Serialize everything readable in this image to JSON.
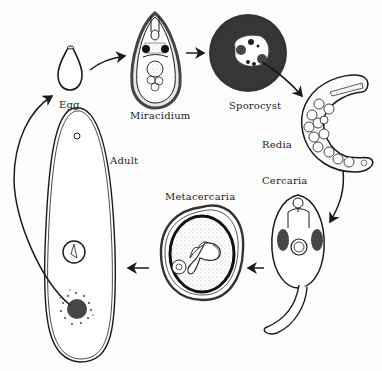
{
  "diagram": {
    "type": "life-cycle",
    "stages": [
      {
        "id": "egg",
        "label": "Egg"
      },
      {
        "id": "miracidium",
        "label": "Miracidium"
      },
      {
        "id": "sporocyst",
        "label": "Sporocyst"
      },
      {
        "id": "redia",
        "label": "Redia"
      },
      {
        "id": "cercaria",
        "label": "Cercaria"
      },
      {
        "id": "metacercaria",
        "label": "Metacercaria"
      },
      {
        "id": "adult",
        "label": "Adult"
      }
    ],
    "flow": [
      [
        "Egg",
        "Miracidium"
      ],
      [
        "Miracidium",
        "Sporocyst"
      ],
      [
        "Sporocyst",
        "Redia"
      ],
      [
        "Redia",
        "Cercaria"
      ],
      [
        "Cercaria",
        "Metacercaria"
      ],
      [
        "Metacercaria",
        "Adult"
      ],
      [
        "Adult",
        "Egg"
      ]
    ],
    "colors": {
      "ink": "#1a1a1a",
      "stipple": "#555555",
      "background": "#fdfdfd"
    }
  }
}
